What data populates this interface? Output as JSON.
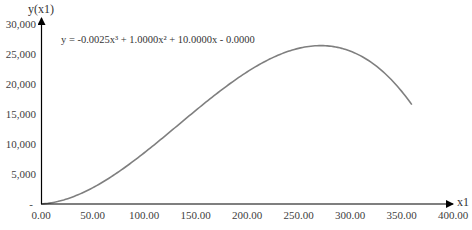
{
  "chart_data": {
    "type": "line",
    "title": "",
    "xlabel": "x1",
    "ylabel": "y(x1)",
    "equation": "y = -0.0025x³ + 1.0000x² + 10.0000x - 0.0000",
    "coefficients": {
      "a3": -0.0025,
      "a2": 1.0,
      "a1": 10.0,
      "a0": 0.0
    },
    "xlim": [
      0,
      400
    ],
    "ylim": [
      0,
      30000
    ],
    "x_ticks": [
      "0.00",
      "50.00",
      "100.00",
      "150.00",
      "200.00",
      "250.00",
      "300.00",
      "350.00",
      "400.00"
    ],
    "y_ticks": [
      "-",
      "5,000",
      "10,000",
      "15,000",
      "20,000",
      "25,000",
      "30,000"
    ],
    "grid": false,
    "legend": null,
    "series": [
      {
        "name": "y(x1)",
        "color": "#7f7f7f",
        "x": [
          0,
          25,
          50,
          75,
          100,
          125,
          150,
          175,
          200,
          225,
          250,
          275,
          300,
          325,
          350,
          360
        ],
        "values": [
          0,
          836,
          2688,
          5320,
          8500,
          11992,
          15563,
          18980,
          22000,
          24395,
          25938,
          26395,
          25500,
          23074,
          18813,
          16560
        ]
      }
    ]
  },
  "colors": {
    "axis": "#000000",
    "curve": "#7f7f7f",
    "text": "#404040"
  }
}
